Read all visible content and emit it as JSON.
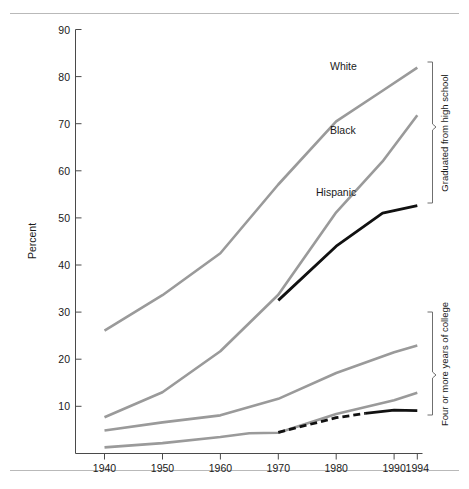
{
  "chart_data": {
    "type": "line",
    "title": "",
    "subtitle": "",
    "xlabel": "",
    "ylabel": "Percent",
    "xlim": [
      1936,
      1996
    ],
    "ylim": [
      0,
      90
    ],
    "grid": false,
    "legend_position": "inline-annotations",
    "x_ticks": [
      "1940",
      "1950",
      "1960",
      "1970",
      "1980",
      "1990",
      "1994"
    ],
    "x_tick_values": [
      1940,
      1950,
      1960,
      1970,
      1980,
      1990,
      1994
    ],
    "y_ticks": [
      "10",
      "20",
      "30",
      "40",
      "50",
      "60",
      "70",
      "80",
      "90"
    ],
    "y_tick_values": [
      10,
      20,
      30,
      40,
      50,
      60,
      70,
      80,
      90
    ],
    "annotations": [
      {
        "name": "group-high-school",
        "text": "Graduated from high school"
      },
      {
        "name": "group-college",
        "text": "Four or more years of college"
      }
    ],
    "series": [
      {
        "name": "White",
        "group": "Graduated from high school",
        "color": "#9a9a9a",
        "style": "solid",
        "label": "White",
        "x": [
          1940,
          1950,
          1960,
          1970,
          1980,
          1988,
          1994
        ],
        "values": [
          26.1,
          33.6,
          42.5,
          57.1,
          70.5,
          77.0,
          81.9
        ]
      },
      {
        "name": "Black",
        "group": "Graduated from high school",
        "color": "#9a9a9a",
        "style": "solid",
        "label": "Black",
        "x": [
          1940,
          1950,
          1960,
          1970,
          1980,
          1988,
          1994
        ],
        "values": [
          7.7,
          13.0,
          21.7,
          33.7,
          51.2,
          62.0,
          71.8
        ]
      },
      {
        "name": "Hispanic",
        "group": "Graduated from high school",
        "color": "#111111",
        "style": "solid",
        "label": "Hispanic",
        "x": [
          1970,
          1980,
          1988,
          1994
        ],
        "values": [
          32.5,
          44.0,
          51.0,
          52.6
        ]
      },
      {
        "name": "White",
        "group": "Four or more years of college",
        "color": "#9a9a9a",
        "style": "solid",
        "label": "",
        "x": [
          1940,
          1950,
          1960,
          1970,
          1980,
          1990,
          1994
        ],
        "values": [
          4.9,
          6.6,
          8.1,
          11.6,
          17.1,
          21.5,
          22.9
        ]
      },
      {
        "name": "Black",
        "group": "Four or more years of college",
        "color": "#9a9a9a",
        "style": "solid",
        "label": "",
        "x": [
          1940,
          1950,
          1960,
          1965,
          1970,
          1980,
          1990,
          1994
        ],
        "values": [
          1.3,
          2.2,
          3.5,
          4.3,
          4.4,
          8.4,
          11.3,
          12.9
        ]
      },
      {
        "name": "Hispanic",
        "group": "Four or more years of college",
        "color": "#111111",
        "style": "dashed-then-solid",
        "label": "",
        "x": [
          1970,
          1980,
          1985,
          1990,
          1994
        ],
        "values": [
          4.5,
          7.6,
          8.5,
          9.2,
          9.1
        ]
      }
    ]
  }
}
